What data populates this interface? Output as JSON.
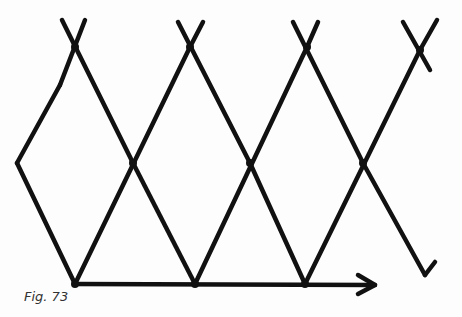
{
  "figure": {
    "caption": "Fig. 73",
    "stroke_color": "#111111",
    "background": "#fdfdfd"
  },
  "lines": [
    [
      17,
      163,
      75,
      284
    ],
    [
      17,
      163,
      60,
      85
    ],
    [
      60,
      85,
      85,
      20
    ],
    [
      62,
      20,
      133,
      163
    ],
    [
      133,
      163,
      195,
      284
    ],
    [
      75,
      284,
      190,
      47
    ],
    [
      190,
      47,
      203,
      22
    ],
    [
      178,
      22,
      250,
      163
    ],
    [
      250,
      163,
      305,
      284
    ],
    [
      195,
      284,
      307,
      47
    ],
    [
      307,
      47,
      318,
      22
    ],
    [
      293,
      22,
      363,
      163
    ],
    [
      363,
      163,
      425,
      275
    ],
    [
      425,
      275,
      435,
      262
    ],
    [
      305,
      284,
      420,
      50
    ],
    [
      420,
      50,
      437,
      20
    ],
    [
      403,
      22,
      430,
      70
    ]
  ],
  "arrow": {
    "x1": 75,
    "y1": 284,
    "x2": 375,
    "y2": 285
  },
  "nodes": [
    [
      75,
      284
    ],
    [
      195,
      284
    ],
    [
      305,
      284
    ],
    [
      133,
      163
    ],
    [
      250,
      163
    ],
    [
      363,
      163
    ],
    [
      75,
      47
    ],
    [
      190,
      47
    ],
    [
      307,
      47
    ],
    [
      420,
      50
    ]
  ]
}
